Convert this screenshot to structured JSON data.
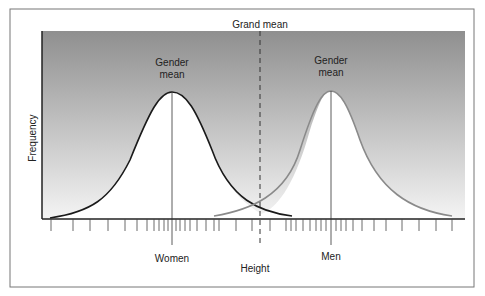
{
  "figure": {
    "grand_mean_label": "Grand mean",
    "women_mean_label_line1": "Gender",
    "women_mean_label_line2": "mean",
    "men_mean_label_line1": "Gender",
    "men_mean_label_line2": "mean",
    "x_axis_label": "Height",
    "y_axis_label": "Frequency",
    "women_label": "Women",
    "men_label": "Men"
  },
  "colors": {
    "women_curve": "#1a1a1a",
    "men_curve": "#8a8a8a",
    "background_top": "#8f8f8f",
    "background_bottom": "#f2f2f2"
  }
}
